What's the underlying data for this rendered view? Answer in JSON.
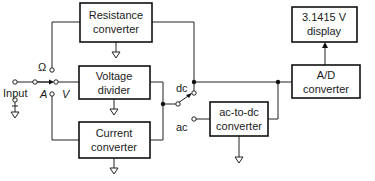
{
  "diagram": {
    "blocks": {
      "resistance": {
        "line1": "Resistance",
        "line2": "converter"
      },
      "voltage": {
        "line1": "Voltage",
        "line2": "divider"
      },
      "current": {
        "line1": "Current",
        "line2": "converter"
      },
      "acdc": {
        "line1": "ac-to-dc",
        "line2": "converter"
      },
      "ad": {
        "line1": "A/D",
        "line2": "converter"
      },
      "display": {
        "line1": "3.1415 V",
        "line2": "display"
      }
    },
    "labels": {
      "input": "Input",
      "ohm": "Ω",
      "amp": "A",
      "volt": "V",
      "dc": "dc",
      "ac": "ac"
    },
    "colors": {
      "stroke": "#111111",
      "background": "#ffffff"
    }
  }
}
